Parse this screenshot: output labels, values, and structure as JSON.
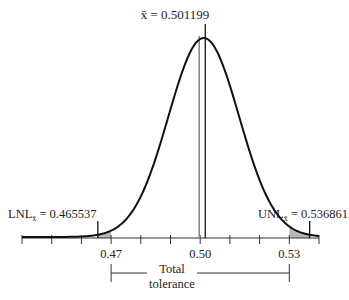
{
  "chart_data": {
    "type": "line",
    "title": "",
    "subtitle": "",
    "xlabel": "",
    "ylabel": "",
    "xlim": [
      0.44,
      0.54
    ],
    "x_ticks": [
      0.44,
      0.45,
      0.46,
      0.47,
      0.48,
      0.49,
      0.5,
      0.51,
      0.52,
      0.53,
      0.54
    ],
    "x_tick_labels": [
      "0.47",
      "0.50",
      "0.53"
    ],
    "x_tick_label_values": [
      0.47,
      0.5,
      0.53
    ],
    "grid": false,
    "legend": null,
    "distribution": {
      "mean": 0.501199,
      "sigma": 0.011887
    },
    "annotations": {
      "mean_label": "x̄ = 0.501199",
      "mean_value": 0.501199,
      "lnl_prefix": "LNL",
      "lnl_subscript": "x̄",
      "lnl_text": " = 0.465537",
      "lnl_value": 0.465537,
      "unl_prefix": "UNL",
      "unl_subscript": "x̄",
      "unl_text": " = 0.536861",
      "unl_value": 0.536861,
      "nominal_value": 0.5,
      "tolerance_label_line1": "Total",
      "tolerance_label_line2": "tolerance",
      "tolerance_range": [
        0.47,
        0.53
      ]
    },
    "shaded_regions": [
      {
        "from": 0.465537,
        "to": 0.47,
        "meaning": "below lower specification"
      },
      {
        "from": 0.53,
        "to": 0.536861,
        "meaning": "above upper specification"
      }
    ],
    "colors": {
      "curve": "#111111",
      "axis": "#333333",
      "shade": "#b8b8b8",
      "nominal_line": "#888888"
    }
  }
}
